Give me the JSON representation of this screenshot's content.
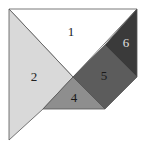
{
  "diagram": {
    "type": "tangram",
    "pieces": [
      {
        "id": "1",
        "label": "1",
        "fill": "#ffffff",
        "label_color": "#222222",
        "points": "9,9 137,9 73,77",
        "label_pos": [
          71,
          33
        ]
      },
      {
        "id": "2",
        "label": "2",
        "fill": "#d9d9d9",
        "label_color": "#222222",
        "points": "9,9 73,77 43,109 9,140",
        "label_pos": [
          34,
          78
        ]
      },
      {
        "id": "4",
        "label": "4",
        "fill": "#8e8e8e",
        "label_color": "#1a1a1a",
        "points": "73,77 105,109 43,109",
        "label_pos": [
          74,
          99
        ]
      },
      {
        "id": "5",
        "label": "5",
        "fill": "#5c5c5c",
        "label_color": "#1a1a1a",
        "points": "73,77 105,45 137,77 105,109",
        "label_pos": [
          104,
          77
        ]
      },
      {
        "id": "6",
        "label": "6",
        "fill": "#3a3a3a",
        "label_color": "#e0e0e0",
        "points": "105,45 137,9 137,77",
        "label_pos": [
          126,
          44
        ]
      }
    ],
    "stroke": "#555555"
  }
}
